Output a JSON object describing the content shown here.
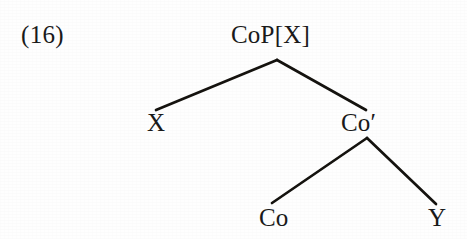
{
  "figure": {
    "example_number": "(16)",
    "kind": "syntax-tree",
    "background_color": "#fefefe",
    "line_color": "#15130f",
    "text_color": "#1a1a1a"
  },
  "chart_data": {
    "type": "diagram",
    "subtype": "syntactic-tree",
    "title": "(16)",
    "nodes": [
      {
        "id": "root",
        "label": "CoP[X]",
        "x": 278,
        "y": 38,
        "role": "root"
      },
      {
        "id": "x",
        "label": "X",
        "x": 156,
        "y": 126,
        "role": "specifier-leaf"
      },
      {
        "id": "cobar",
        "label": "Co′",
        "x": 367,
        "y": 126,
        "role": "intermediate"
      },
      {
        "id": "co",
        "label": "Co",
        "x": 272,
        "y": 221,
        "role": "head-leaf"
      },
      {
        "id": "y",
        "label": "Y",
        "x": 437,
        "y": 221,
        "role": "complement-leaf"
      }
    ],
    "edges": [
      {
        "from": "root",
        "to": "x",
        "x1": 277,
        "y1": 60,
        "x2": 156,
        "y2": 110
      },
      {
        "from": "root",
        "to": "cobar",
        "x1": 277,
        "y1": 60,
        "x2": 366,
        "y2": 110
      },
      {
        "from": "cobar",
        "to": "co",
        "x1": 367,
        "y1": 138,
        "x2": 272,
        "y2": 203
      },
      {
        "from": "cobar",
        "to": "y",
        "x1": 367,
        "y1": 138,
        "x2": 436,
        "y2": 204
      }
    ]
  },
  "labels": {
    "example_number": "(16)",
    "root": "CoP[X]",
    "specifier": "X",
    "intermediate": "Co′",
    "head": "Co",
    "complement": "Y"
  }
}
